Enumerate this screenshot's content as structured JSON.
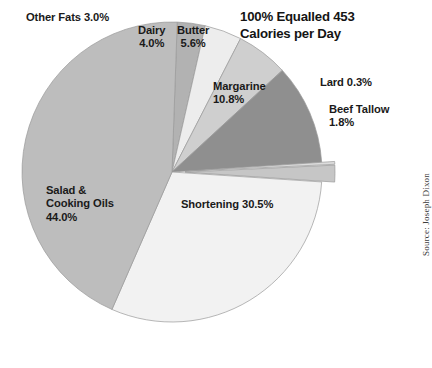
{
  "chart_data": {
    "type": "pie",
    "title_line1": "100% Equalled 453",
    "title_line2": "Calories per Day",
    "xlabel": "",
    "ylabel": "",
    "legend": "none",
    "grid": false,
    "units": "percent",
    "total_label": "100% Equalled 453 Calories per Day",
    "total_calories": 453,
    "source": "Source: Joseph Dixon",
    "categories": [
      "Other Fats",
      "Dairy",
      "Butter",
      "Margarine",
      "Lard",
      "Beef Tallow",
      "Shortening",
      "Salad & Cooking Oils"
    ],
    "values": [
      3.0,
      4.0,
      5.6,
      10.8,
      0.3,
      1.8,
      30.5,
      44.0
    ],
    "slices": [
      {
        "name": "Other Fats",
        "value": 3.0,
        "label": "Other Fats 3.0%",
        "color": "#b2b2b2",
        "exploded": false
      },
      {
        "name": "Dairy",
        "value": 4.0,
        "label": "Dairy\n4.0%",
        "color": "#ededed",
        "exploded": false
      },
      {
        "name": "Butter",
        "value": 5.6,
        "label": "Butter\n5.6%",
        "color": "#cfcfcf",
        "exploded": false
      },
      {
        "name": "Margarine",
        "value": 10.8,
        "label": "Margarine\n10.8%",
        "color": "#8f8f8f",
        "exploded": false
      },
      {
        "name": "Lard",
        "value": 0.3,
        "label": "Lard 0.3%",
        "color": "#dcdcdc",
        "exploded": true
      },
      {
        "name": "Beef Tallow",
        "value": 1.8,
        "label": "Beef Tallow\n1.8%",
        "color": "#c6c6c6",
        "exploded": true
      },
      {
        "name": "Shortening",
        "value": 30.5,
        "label": "Shortening 30.5%",
        "color": "#f2f2f2",
        "exploded": false
      },
      {
        "name": "Salad & Cooking Oils",
        "value": 44.0,
        "label": "Salad &\nCooking Oils\n44.0%",
        "color": "#bdbdbd",
        "exploded": false
      }
    ]
  },
  "labels": {
    "other_fats": "Other Fats 3.0%",
    "dairy_line1": "Dairy",
    "dairy_line2": "4.0%",
    "butter_line1": "Butter",
    "butter_line2": "5.6%",
    "margarine_line1": "Margarine",
    "margarine_line2": "10.8%",
    "lard": "Lard 0.3%",
    "beef_line1": "Beef Tallow",
    "beef_line2": "1.8%",
    "shortening": "Shortening 30.5%",
    "salad_line1": "Salad &",
    "salad_line2": "Cooking Oils",
    "salad_line3": "44.0%"
  },
  "title": {
    "line1": "100% Equalled 453",
    "line2": "Calories per Day"
  },
  "source": {
    "text": "Source: Joseph Dixon"
  },
  "colors": {
    "outline": "#9a9a9a",
    "text": "#1a1a1a",
    "background": "#ffffff"
  }
}
